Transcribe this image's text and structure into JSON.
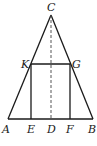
{
  "diagram": {
    "points": {
      "A": "A",
      "B": "B",
      "C": "C",
      "D": "D",
      "E": "E",
      "F": "F",
      "G": "G",
      "K": "K"
    },
    "segments": [
      {
        "name": "AC",
        "style": "solid"
      },
      {
        "name": "BC",
        "style": "solid"
      },
      {
        "name": "AB",
        "style": "solid"
      },
      {
        "name": "KG",
        "style": "solid"
      },
      {
        "name": "KE",
        "style": "solid"
      },
      {
        "name": "GF",
        "style": "solid"
      },
      {
        "name": "CD",
        "style": "dashed"
      }
    ],
    "colors": {
      "line": "#1a1a1a",
      "dashed": "#555555",
      "background": "#ffffff"
    }
  }
}
